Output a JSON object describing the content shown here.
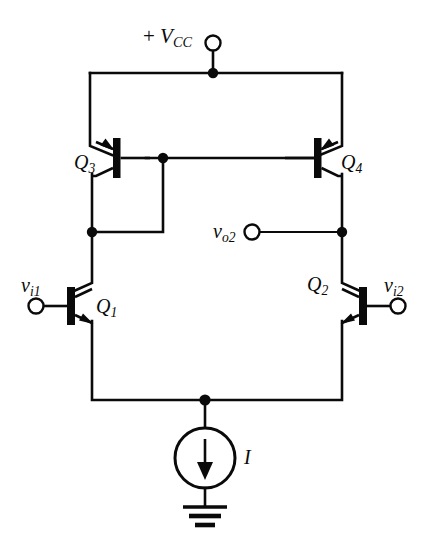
{
  "figure": {
    "type": "circuit-schematic",
    "background_color": "#ffffff",
    "line_color": "#0a0a0a"
  },
  "labels": {
    "supply": {
      "sign": "+",
      "symbol": "V",
      "subscript": "CC",
      "text": "+ VCC"
    },
    "q3": {
      "symbol": "Q",
      "subscript": "3",
      "text": "Q3"
    },
    "q4": {
      "symbol": "Q",
      "subscript": "4",
      "text": "Q4"
    },
    "q1": {
      "symbol": "Q",
      "subscript": "1",
      "text": "Q1"
    },
    "q2": {
      "symbol": "Q",
      "subscript": "2",
      "text": "Q2"
    },
    "vi1": {
      "symbol": "v",
      "subscript": "i1",
      "text": "vi1"
    },
    "vi2": {
      "symbol": "v",
      "subscript": "i2",
      "text": "vi2"
    },
    "vo2": {
      "symbol": "v",
      "subscript": "o2",
      "text": "vo2"
    },
    "current_source": {
      "symbol": "I",
      "text": "I"
    }
  },
  "components": [
    {
      "name": "Q3",
      "kind": "pnp-transistor",
      "role": "mirror-reference"
    },
    {
      "name": "Q4",
      "kind": "pnp-transistor",
      "role": "mirror-output"
    },
    {
      "name": "Q1",
      "kind": "npn-transistor",
      "role": "diff-pair-left"
    },
    {
      "name": "Q2",
      "kind": "npn-transistor",
      "role": "diff-pair-right"
    },
    {
      "name": "I",
      "kind": "current-source",
      "role": "tail-bias",
      "direction": "down"
    },
    {
      "name": "GND",
      "kind": "ground",
      "role": "reference"
    }
  ],
  "terminals": [
    {
      "name": "+VCC",
      "kind": "open-circle"
    },
    {
      "name": "vi1",
      "kind": "open-circle"
    },
    {
      "name": "vi2",
      "kind": "open-circle"
    },
    {
      "name": "vo2",
      "kind": "open-circle"
    }
  ]
}
